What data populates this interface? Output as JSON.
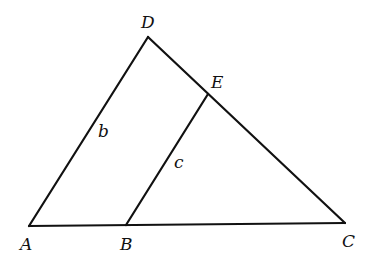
{
  "diagram": {
    "type": "geometry-triangle",
    "points": {
      "A": {
        "label": "A",
        "x": 29,
        "y": 226
      },
      "B": {
        "label": "B",
        "x": 126,
        "y": 225
      },
      "C": {
        "label": "C",
        "x": 345,
        "y": 223
      },
      "D": {
        "label": "D",
        "x": 148,
        "y": 37
      },
      "E": {
        "label": "E",
        "x": 208,
        "y": 94
      }
    },
    "segments": [
      {
        "from": "A",
        "to": "D",
        "label": "b"
      },
      {
        "from": "D",
        "to": "C",
        "label": ""
      },
      {
        "from": "A",
        "to": "C",
        "label": ""
      },
      {
        "from": "B",
        "to": "E",
        "label": "c"
      }
    ],
    "side_labels": {
      "b": "b",
      "c": "c"
    },
    "colors": {
      "stroke": "#111111",
      "background": "#ffffff"
    }
  }
}
